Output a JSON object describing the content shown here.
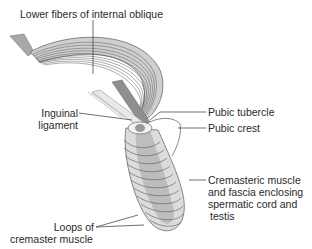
{
  "diagram": {
    "labels": {
      "lower_fibers": "Lower fibers of internal oblique",
      "inguinal_1": "Inguinal",
      "inguinal_2": "ligament",
      "pubic_tubercle": "Pubic tubercle",
      "pubic_crest": "Pubic crest",
      "cremasteric_1": "Cremasteric muscle",
      "cremasteric_2": "and fascia enclosing",
      "cremasteric_3": "spermatic cord and",
      "cremasteric_4": "testis",
      "loops_1": "Loops of",
      "loops_2": "cremaster muscle"
    },
    "colors": {
      "muscle_fill": "#c9c9c9",
      "muscle_dark": "#8e8e8e",
      "fiber_line": "#555555",
      "sac_fill": "#dcdcdc",
      "sac_inner": "#b8b8b8",
      "leader_line": "#333333"
    }
  }
}
